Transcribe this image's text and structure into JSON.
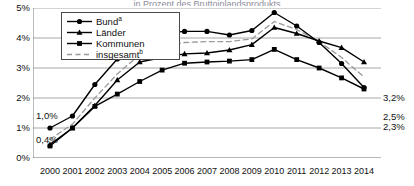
{
  "title_partial": "… in Prozent des Bruttoinlandsprodukts …",
  "legend": {
    "items": [
      {
        "label": "Bund",
        "sup": "a",
        "marker": "circle",
        "style": "solid",
        "name": "legend-item-bund"
      },
      {
        "label": "Länder",
        "sup": "",
        "marker": "triangle",
        "style": "solid",
        "name": "legend-item-laender"
      },
      {
        "label": "Kommunen",
        "sup": "",
        "marker": "square",
        "style": "solid",
        "name": "legend-item-kommunen"
      },
      {
        "label": "insgesamt",
        "sup": "b",
        "marker": "none",
        "style": "dashed",
        "name": "legend-item-insgesamt"
      }
    ]
  },
  "annotations": [
    {
      "text": "1,0%",
      "name": "annotation-start-bund",
      "x": 36,
      "y": 111
    },
    {
      "text": "0,4%",
      "name": "annotation-start-kommunen",
      "x": 36,
      "y": 135
    },
    {
      "text": "3,2%",
      "name": "annotation-end-laender",
      "x": 383,
      "y": 93
    },
    {
      "text": "2,5%",
      "name": "annotation-end-bund",
      "x": 383,
      "y": 112
    },
    {
      "text": "2,3%",
      "name": "annotation-end-kommunen",
      "x": 383,
      "y": 122
    }
  ],
  "chart_data": {
    "type": "line",
    "title": "",
    "xlabel": "",
    "ylabel": "",
    "ylim": [
      0,
      5
    ],
    "yticks": [
      "0%",
      "1%",
      "2%",
      "3%",
      "4%",
      "5%"
    ],
    "ytick_values": [
      0,
      1,
      2,
      3,
      4,
      5
    ],
    "grid": true,
    "legend_position": "top-left-inside",
    "categories": [
      "2000",
      "2001",
      "2002",
      "2003",
      "2004",
      "2005",
      "2006",
      "2007",
      "2008",
      "2009",
      "2010",
      "2011",
      "2012",
      "2013",
      "2014"
    ],
    "series": [
      {
        "name": "Bund",
        "footnote": "a",
        "marker": "circle",
        "linestyle": "solid",
        "color": "#000000",
        "values": [
          1.0,
          1.4,
          2.45,
          3.3,
          3.9,
          4.15,
          4.22,
          4.22,
          4.1,
          4.25,
          4.85,
          4.4,
          3.85,
          3.15,
          2.35
        ]
      },
      {
        "name": "Länder",
        "footnote": "",
        "marker": "triangle",
        "linestyle": "solid",
        "color": "#000000",
        "values": [
          0.45,
          1.0,
          1.75,
          2.6,
          3.2,
          3.35,
          3.47,
          3.5,
          3.6,
          3.78,
          4.35,
          4.15,
          3.9,
          3.68,
          3.2
        ]
      },
      {
        "name": "Kommunen",
        "footnote": "",
        "marker": "square",
        "linestyle": "solid",
        "color": "#000000",
        "values": [
          0.4,
          1.0,
          1.72,
          2.13,
          2.55,
          2.93,
          3.16,
          3.2,
          3.23,
          3.28,
          3.62,
          3.28,
          3.0,
          2.67,
          2.3
        ]
      },
      {
        "name": "insgesamt",
        "footnote": "b",
        "marker": "none",
        "linestyle": "dashed",
        "color": "#9a9a9a",
        "values": [
          0.62,
          1.13,
          2.0,
          2.8,
          3.45,
          3.72,
          3.85,
          3.88,
          3.88,
          3.97,
          4.55,
          4.28,
          3.88,
          3.35,
          2.7
        ]
      }
    ]
  }
}
